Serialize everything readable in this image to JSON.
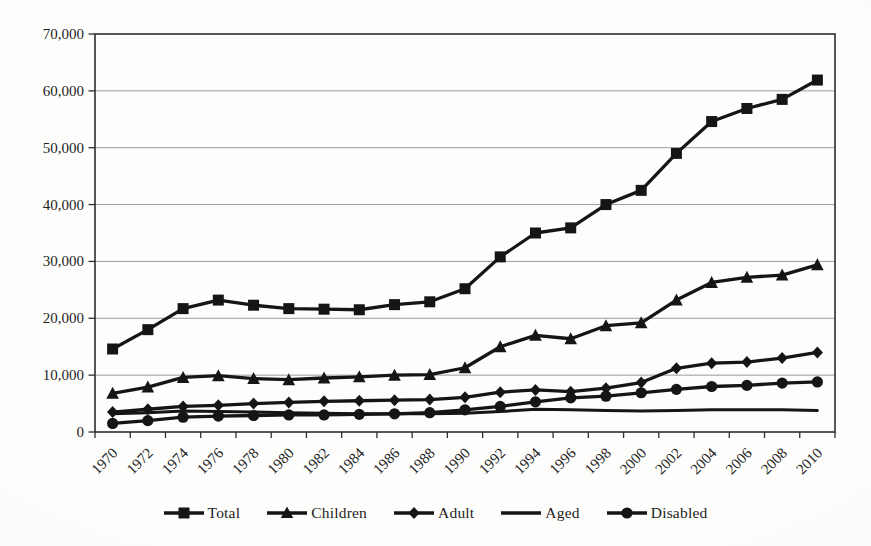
{
  "chart_data": {
    "type": "line",
    "title": "",
    "xlabel": "",
    "ylabel": "",
    "ylim": [
      0,
      70000
    ],
    "y_tick_step": 10000,
    "y_ticks": [
      "0",
      "10,000",
      "20,000",
      "30,000",
      "40,000",
      "50,000",
      "60,000",
      "70,000"
    ],
    "grid": "horizontal",
    "legend_position": "bottom",
    "monochrome": true,
    "categories": [
      "1970",
      "1972",
      "1974",
      "1976",
      "1978",
      "1980",
      "1982",
      "1984",
      "1986",
      "1988",
      "1990",
      "1992",
      "1994",
      "1996",
      "1998",
      "2000",
      "2002",
      "2004",
      "2006",
      "2008",
      "2010"
    ],
    "series": [
      {
        "name": "Total",
        "marker": "square",
        "values": [
          14600,
          18000,
          21700,
          23200,
          22300,
          21700,
          21600,
          21500,
          22400,
          22900,
          25200,
          30800,
          35000,
          35900,
          40000,
          42500,
          49000,
          54600,
          56900,
          58500,
          61900
        ]
      },
      {
        "name": "Children",
        "marker": "triangle",
        "values": [
          6800,
          7900,
          9600,
          9900,
          9400,
          9200,
          9500,
          9700,
          10000,
          10100,
          11300,
          15000,
          17000,
          16400,
          18700,
          19200,
          23200,
          26300,
          27200,
          27600,
          29400
        ]
      },
      {
        "name": "Adult",
        "marker": "diamond",
        "values": [
          3500,
          4000,
          4500,
          4700,
          5000,
          5200,
          5400,
          5500,
          5600,
          5700,
          6100,
          7000,
          7400,
          7100,
          7700,
          8700,
          11200,
          12100,
          12300,
          13000,
          14000
        ]
      },
      {
        "name": "Aged",
        "marker": "none",
        "values": [
          3200,
          3400,
          3700,
          3600,
          3500,
          3400,
          3300,
          3200,
          3200,
          3200,
          3300,
          3600,
          4000,
          3900,
          3800,
          3700,
          3800,
          3900,
          3900,
          3900,
          3800
        ]
      },
      {
        "name": "Disabled",
        "marker": "circle",
        "values": [
          1500,
          2000,
          2600,
          2800,
          2900,
          3000,
          3000,
          3100,
          3200,
          3400,
          3900,
          4500,
          5300,
          6000,
          6300,
          6900,
          7500,
          8000,
          8200,
          8600,
          8800
        ]
      }
    ],
    "colors": {
      "series_line": "#151515",
      "marker_fill": "#151515",
      "gridline": "#9b9b9b",
      "axis": "#2e2e2e",
      "tick_text": "#1f1f1f",
      "background": "#fdfdfc"
    }
  }
}
